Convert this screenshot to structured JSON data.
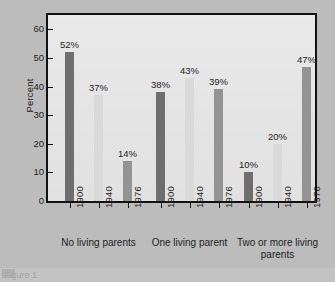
{
  "chart_data": {
    "type": "bar",
    "title": "",
    "subtitle": "",
    "xlabel": "",
    "ylabel": "Percent",
    "ylim": [
      0,
      65
    ],
    "yticks": [
      0,
      10,
      20,
      30,
      40,
      50,
      60
    ],
    "ytick_labels": [
      "0",
      "10",
      "20",
      "30",
      "40",
      "50",
      "60"
    ],
    "grid": false,
    "legend_position": "none",
    "categories": [
      "No living parents",
      "One living parent",
      "Two or more living parents"
    ],
    "x": [
      "1900",
      "1940",
      "1976"
    ],
    "series": [
      {
        "name": "1900",
        "color": "#6e6e6e",
        "values": [
          52,
          38,
          10
        ]
      },
      {
        "name": "1940",
        "color": "#d9d9d9",
        "values": [
          37,
          43,
          20
        ]
      },
      {
        "name": "1976",
        "color": "#939393",
        "values": [
          14,
          39,
          47
        ]
      }
    ],
    "bars": [
      {
        "group": "No living parents",
        "year": "1900",
        "value": 52,
        "label": "52%",
        "color": "#6e6e6e"
      },
      {
        "group": "No living parents",
        "year": "1940",
        "value": 37,
        "label": "37%",
        "color": "#d9d9d9"
      },
      {
        "group": "No living parents",
        "year": "1976",
        "value": 14,
        "label": "14%",
        "color": "#939393"
      },
      {
        "group": "One living parent",
        "year": "1900",
        "value": 38,
        "label": "38%",
        "color": "#6e6e6e"
      },
      {
        "group": "One living parent",
        "year": "1940",
        "value": 43,
        "label": "43%",
        "color": "#d9d9d9"
      },
      {
        "group": "One living parent",
        "year": "1976",
        "value": 39,
        "label": "39%",
        "color": "#939393"
      },
      {
        "group": "Two or more living parents",
        "year": "1900",
        "value": 10,
        "label": "10%",
        "color": "#6e6e6e"
      },
      {
        "group": "Two or more living parents",
        "year": "1940",
        "value": 20,
        "label": "20%",
        "color": "#d9d9d9"
      },
      {
        "group": "Two or more living parents",
        "year": "1976",
        "value": 47,
        "label": "47%",
        "color": "#939393"
      }
    ],
    "group_labels": [
      {
        "text": "No living parents",
        "lines": [
          "No living parents"
        ]
      },
      {
        "text": "One living parent",
        "lines": [
          "One living parent"
        ]
      },
      {
        "text": "Two or more living parents",
        "lines": [
          "Two or more living",
          "parents"
        ]
      }
    ]
  },
  "figure": {
    "background_color": "#bcbcbc",
    "plot_background_color": "#e6e6e6",
    "axis_color": "#121212",
    "text_color": "#1d1d1d"
  },
  "caption": {
    "text": "Figure 1"
  }
}
